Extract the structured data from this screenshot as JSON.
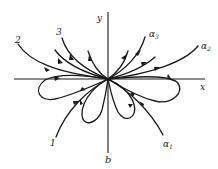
{
  "figure": {
    "caption": "b",
    "axes": {
      "x_label": "x",
      "y_label": "y"
    },
    "curve_labels": [
      {
        "id": "curve-1",
        "text": "1",
        "sub": ""
      },
      {
        "id": "curve-2",
        "text": "2",
        "sub": ""
      },
      {
        "id": "curve-3",
        "text": "3",
        "sub": ""
      },
      {
        "id": "curve-alpha1",
        "text": "α",
        "sub": "1"
      },
      {
        "id": "curve-alpha2",
        "text": "α",
        "sub": "2"
      },
      {
        "id": "curve-alpha3",
        "text": "α",
        "sub": "3"
      }
    ],
    "colors": {
      "ink": "#1a1a1a",
      "background": "#ffffff"
    }
  }
}
